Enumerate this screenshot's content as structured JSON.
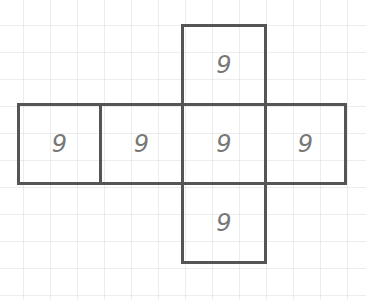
{
  "diagram": {
    "type": "cube-net",
    "faces": [
      {
        "id": "top",
        "label": "9"
      },
      {
        "id": "left-end",
        "label": "9"
      },
      {
        "id": "left",
        "label": "9"
      },
      {
        "id": "center",
        "label": "9"
      },
      {
        "id": "right",
        "label": "9"
      },
      {
        "id": "bottom",
        "label": "9"
      }
    ]
  },
  "colors": {
    "outline": "#555555",
    "label": "#777777",
    "grid": "#ededed",
    "background": "#ffffff"
  }
}
